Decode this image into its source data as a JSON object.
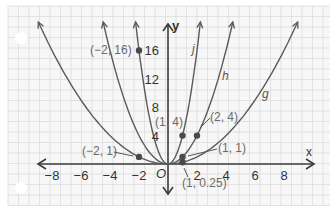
{
  "chart_data": {
    "type": "line",
    "title": "",
    "xlabel": "x",
    "ylabel": "y",
    "origin_label": "O",
    "xlim": [
      -9,
      9.5
    ],
    "ylim": [
      -3.5,
      19.5
    ],
    "grid": true,
    "x_ticks": [
      -8,
      -6,
      -4,
      -2,
      2,
      4,
      6,
      8
    ],
    "x_tick_labels": [
      "−8",
      "−6",
      "−4",
      "−2",
      "2",
      "4",
      "6",
      "8"
    ],
    "y_ticks": [
      4,
      8,
      12,
      16
    ],
    "y_tick_labels": [
      "4",
      "8",
      "12",
      "16"
    ],
    "series": [
      {
        "name": "j",
        "equation": "y = 4x^2",
        "coef": 4
      },
      {
        "name": "h",
        "equation": "y = x^2",
        "coef": 1
      },
      {
        "name": "g",
        "equation": "y = 0.25x^2",
        "coef": 0.25
      }
    ],
    "points": [
      {
        "label": "(−2, 16)",
        "x": -2,
        "y": 16
      },
      {
        "label": "(−2, 1)",
        "x": -2,
        "y": 1
      },
      {
        "label": "(1, 4)",
        "x": 1,
        "y": 4
      },
      {
        "label": "(2, 4)",
        "x": 2,
        "y": 4
      },
      {
        "label": "(1, 1)",
        "x": 1,
        "y": 1
      },
      {
        "label": "(1, 0.25)",
        "x": 1,
        "y": 0.25
      }
    ],
    "curve_labels": [
      "j",
      "h",
      "g"
    ]
  },
  "colors": {
    "grid": "#dcdcdc",
    "curve": "#5a5a5a",
    "axis": "#3a3a3a",
    "point": "#4a4a4a",
    "label": "#6a6a6a",
    "tick_label": "#333333"
  }
}
